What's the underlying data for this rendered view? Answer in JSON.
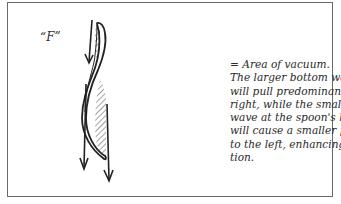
{
  "figure": {
    "label": "“F”",
    "caption_lines": [
      "=  Area of vacuum.",
      "The larger bottom wave",
      "will pull predominantly",
      "right, while the smaller",
      "wave at the spoon's head",
      "will cause a smaller pull",
      "to the left, enhancing ac-",
      "tion."
    ],
    "elements": {
      "spoon": "S-curved spoon shape, vertical orientation",
      "hatched_areas": [
        "upper-left (head) vacuum area",
        "lower-right (body) vacuum area"
      ],
      "arrows": [
        "upper-left short downward arrow",
        "lower-left long downward arrow",
        "lower-right long downward arrow"
      ]
    },
    "colors": {
      "ink": "#222222",
      "border": "#6a6a6a",
      "background": "#ffffff"
    }
  }
}
